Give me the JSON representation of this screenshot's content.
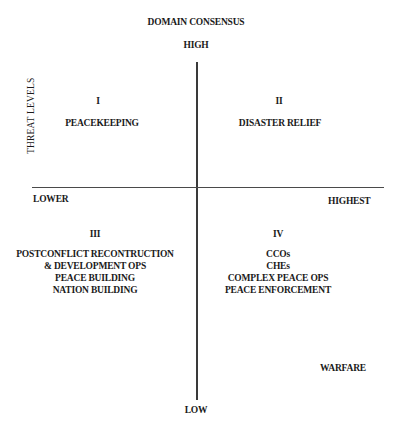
{
  "diagram": {
    "title": "DOMAIN CONSENSUS",
    "axes": {
      "vertical_top": "HIGH",
      "vertical_bottom": "LOW",
      "horizontal_left": "LOWER",
      "horizontal_right": "HIGHEST",
      "horizontal_title": "THREAT LEVELS"
    },
    "quadrants": [
      {
        "numeral": "I",
        "items": [
          "PEACEKEEPING"
        ]
      },
      {
        "numeral": "II",
        "items": [
          "DISASTER RELIEF"
        ]
      },
      {
        "numeral": "III",
        "items": [
          "POSTCONFLICT RECONTRUCTION",
          "& DEVELOPMENT OPS",
          "PEACE BUILDING",
          "NATION BUILDING"
        ]
      },
      {
        "numeral": "IV",
        "items": [
          "CCOs",
          "CHEs",
          "COMPLEX PEACE OPS",
          "PEACE ENFORCEMENT"
        ]
      }
    ],
    "extra_label": "WARFARE"
  }
}
